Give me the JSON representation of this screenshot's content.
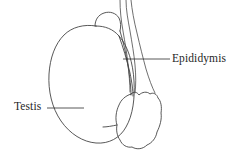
{
  "figure": {
    "type": "anatomical-line-diagram",
    "background_color": "#ffffff",
    "line_color": "#3a3a3a",
    "text_color": "#262626"
  },
  "labels": {
    "epididymis": {
      "text": "Epididymis",
      "leader": "horizontal-line-left"
    },
    "testis": {
      "text": "Testis",
      "leader": "horizontal-line-right"
    }
  },
  "structures": {
    "testis_body": "large-oval",
    "epididymis_head": "small-bump-top",
    "epididymis_body": "elongated-band",
    "epididymis_tail": "lobulated-blob-bottom",
    "spermatic_cord": "three-tubes-upward"
  }
}
